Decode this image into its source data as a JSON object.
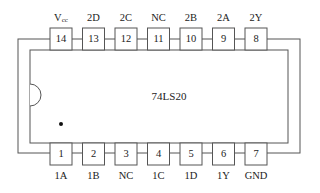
{
  "chip": {
    "name": "74LS20",
    "package": "DIP-14",
    "notch": "left",
    "pin1_marker": "dot"
  },
  "top_pins": [
    {
      "number": "14",
      "label": "Vcc"
    },
    {
      "number": "13",
      "label": "2D"
    },
    {
      "number": "12",
      "label": "2C"
    },
    {
      "number": "11",
      "label": "NC"
    },
    {
      "number": "10",
      "label": "2B"
    },
    {
      "number": "9",
      "label": "2A"
    },
    {
      "number": "8",
      "label": "2Y"
    }
  ],
  "bottom_pins": [
    {
      "number": "1",
      "label": "1A"
    },
    {
      "number": "2",
      "label": "1B"
    },
    {
      "number": "3",
      "label": "NC"
    },
    {
      "number": "4",
      "label": "1C"
    },
    {
      "number": "5",
      "label": "1D"
    },
    {
      "number": "6",
      "label": "1Y"
    },
    {
      "number": "7",
      "label": "GND"
    }
  ],
  "vcc": {
    "main": "V",
    "sub": "cc"
  },
  "colors": {
    "stroke": "#555555",
    "text": "#222222"
  }
}
